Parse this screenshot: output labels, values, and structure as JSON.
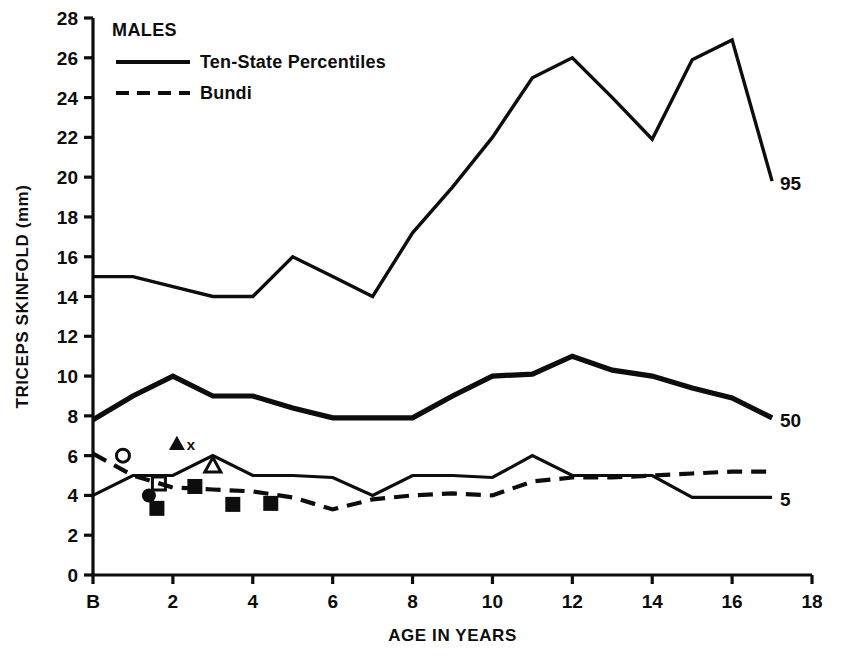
{
  "chart_data": {
    "type": "line",
    "title": "MALES",
    "xlabel": "AGE IN YEARS",
    "ylabel": "TRICEPS SKINFOLD (mm)",
    "xlim": [
      0,
      18
    ],
    "ylim": [
      0,
      28
    ],
    "grid": false,
    "legend_position": "top-left",
    "x_tick_labels": [
      "B",
      "2",
      "4",
      "6",
      "8",
      "10",
      "12",
      "14",
      "16",
      "18"
    ],
    "x_tick_values": [
      0,
      2,
      4,
      6,
      8,
      10,
      12,
      14,
      16,
      18
    ],
    "y_tick_labels": [
      "0",
      "2",
      "4",
      "6",
      "8",
      "10",
      "12",
      "14",
      "16",
      "18",
      "20",
      "22",
      "24",
      "26",
      "28"
    ],
    "y_tick_values": [
      0,
      2,
      4,
      6,
      8,
      10,
      12,
      14,
      16,
      18,
      20,
      22,
      24,
      26,
      28
    ],
    "legend": [
      {
        "label": "Ten-State Percentiles",
        "style": "solid"
      },
      {
        "label": "Bundi",
        "style": "dashed"
      }
    ],
    "series": [
      {
        "name": "Ten-State Percentiles 95th",
        "style": "solid",
        "end_label": "95",
        "x": [
          0,
          1,
          2,
          3,
          4,
          5,
          6,
          7,
          8,
          9,
          10,
          11,
          12,
          13,
          14,
          15,
          16,
          17
        ],
        "values": [
          15.0,
          15.0,
          14.5,
          14.0,
          14.0,
          16.0,
          15.0,
          14.0,
          17.2,
          19.5,
          22.0,
          25.0,
          26.0,
          24.0,
          21.9,
          25.9,
          26.9,
          19.8
        ]
      },
      {
        "name": "Ten-State Percentiles 50th",
        "style": "solid",
        "end_label": "50",
        "x": [
          0,
          1,
          2,
          3,
          4,
          5,
          6,
          7,
          8,
          9,
          10,
          11,
          12,
          13,
          14,
          15,
          16,
          17
        ],
        "values": [
          7.8,
          9.0,
          10.0,
          9.0,
          9.0,
          8.4,
          7.9,
          7.9,
          7.9,
          9.0,
          10.0,
          10.1,
          11.0,
          10.3,
          10.0,
          9.4,
          8.9,
          7.9
        ]
      },
      {
        "name": "Ten-State Percentiles 5th",
        "style": "solid",
        "end_label": "5",
        "x": [
          0,
          1,
          2,
          3,
          4,
          5,
          6,
          7,
          8,
          9,
          10,
          11,
          12,
          13,
          14,
          15,
          16,
          17
        ],
        "values": [
          4.0,
          5.0,
          5.0,
          6.0,
          5.0,
          5.0,
          4.9,
          4.0,
          5.0,
          5.0,
          4.9,
          6.0,
          5.0,
          5.0,
          5.0,
          3.9,
          3.9,
          3.9
        ]
      },
      {
        "name": "Bundi",
        "style": "dashed",
        "end_label": "",
        "x": [
          0,
          1,
          2,
          3,
          4,
          5,
          6,
          7,
          8,
          9,
          10,
          11,
          12,
          13,
          14,
          15,
          16,
          17
        ],
        "values": [
          6.1,
          5.0,
          4.4,
          4.3,
          4.2,
          3.9,
          3.3,
          3.8,
          4.0,
          4.1,
          4.0,
          4.7,
          4.9,
          4.9,
          5.0,
          5.1,
          5.2,
          5.2
        ]
      }
    ],
    "scatter_points": [
      {
        "marker": "open-circle",
        "x": 0.75,
        "y": 6.0
      },
      {
        "marker": "filled-triangle",
        "x": 2.1,
        "y": 6.6
      },
      {
        "marker": "x-mark",
        "x": 2.45,
        "y": 6.6
      },
      {
        "marker": "open-triangle",
        "x": 3.0,
        "y": 5.5
      },
      {
        "marker": "open-square",
        "x": 1.65,
        "y": 4.6
      },
      {
        "marker": "filled-circle",
        "x": 1.4,
        "y": 4.0
      },
      {
        "marker": "filled-square",
        "x": 1.6,
        "y": 3.35
      },
      {
        "marker": "filled-square",
        "x": 2.55,
        "y": 4.45
      },
      {
        "marker": "filled-square",
        "x": 3.5,
        "y": 3.55
      },
      {
        "marker": "filled-square",
        "x": 4.45,
        "y": 3.6
      }
    ]
  }
}
